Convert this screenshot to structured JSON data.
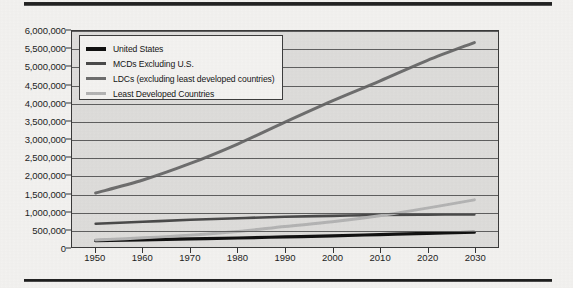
{
  "figure": {
    "top_rule": "horizontal-rule",
    "bottom_rule": "horizontal-rule"
  },
  "legend": {
    "position": "top-left-inside-plot",
    "entries": [
      {
        "label": "United States",
        "color": "#111111"
      },
      {
        "label": "MCDs Excluding U.S.",
        "color": "#4a4a4a"
      },
      {
        "label": "LDCs (excluding least developed countries)",
        "color": "#6e6e6e"
      },
      {
        "label": "Least Developed Countries",
        "color": "#b4b4b4"
      }
    ]
  },
  "chart_data": {
    "type": "line",
    "title": "",
    "xlabel": "",
    "ylabel": "",
    "xlim": [
      1945,
      2035
    ],
    "ylim": [
      0,
      6000000
    ],
    "grid": true,
    "legend_position": "upper left",
    "x": [
      1950,
      1960,
      1970,
      1980,
      1990,
      2000,
      2010,
      2020,
      2030
    ],
    "xticks": [
      "1950",
      "1960",
      "1970",
      "1980",
      "1990",
      "2000",
      "2010",
      "2020",
      "2030"
    ],
    "yticks": [
      "0",
      "500,000",
      "1,000,000",
      "1,500,000",
      "2,000,000",
      "2,500,000",
      "3,000,000",
      "3,500,000",
      "4,000,000",
      "4,500,000",
      "5,000,000",
      "5,500,000",
      "6,000,000"
    ],
    "ytick_values": [
      0,
      500000,
      1000000,
      1500000,
      2000000,
      2500000,
      3000000,
      3500000,
      4000000,
      4500000,
      5000000,
      5500000,
      6000000
    ],
    "series": [
      {
        "name": "United States",
        "color": "#111111",
        "width": 3.2,
        "values": [
          175000,
          200000,
          225000,
          250000,
          280000,
          310000,
          345000,
          380000,
          410000
        ]
      },
      {
        "name": "MCDs Excluding U.S.",
        "color": "#4a4a4a",
        "width": 2.6,
        "values": [
          645000,
          700000,
          755000,
          800000,
          840000,
          865000,
          890000,
          900000,
          905000
        ]
      },
      {
        "name": "LDCs (excluding least developed countries)",
        "color": "#6e6e6e",
        "width": 3.0,
        "values": [
          1500000,
          1860000,
          2320000,
          2860000,
          3470000,
          4060000,
          4610000,
          5180000,
          5680000
        ]
      },
      {
        "name": "Least Developed Countries",
        "color": "#b4b4b4",
        "width": 3.0,
        "values": [
          195000,
          255000,
          330000,
          430000,
          570000,
          700000,
          870000,
          1080000,
          1310000
        ]
      }
    ]
  }
}
